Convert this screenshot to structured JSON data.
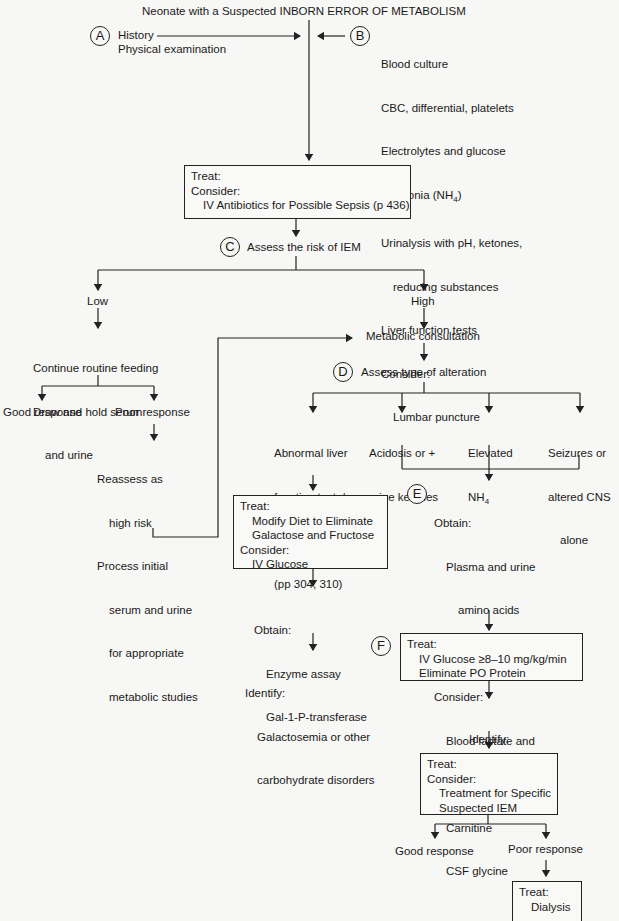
{
  "title": "Neonate with a Suspected INBORN ERROR OF METABOLISM",
  "step_a": {
    "marker": "A",
    "lines": [
      "History",
      "Physical examination"
    ]
  },
  "step_b": {
    "marker": "B",
    "lines": [
      "Blood culture",
      "CBC, differential, platelets",
      "Electrolytes and glucose",
      "Ammonia (NH4)",
      "Urinalysis with pH, ketones,",
      "reducing substances",
      "Liver function tests",
      "Consider:",
      "Lumbar puncture"
    ]
  },
  "treat_sepsis": {
    "lines": [
      "Treat:",
      "Consider:",
      "IV Antibiotics for Possible Sepsis (p 436)"
    ]
  },
  "step_c": {
    "marker": "C",
    "label": "Assess the risk of IEM"
  },
  "low": {
    "label": "Low",
    "action": [
      "Continue routine feeding",
      "Draw and hold serum",
      "and urine"
    ],
    "good": "Good response",
    "poor": "Poor response",
    "reassess": [
      "Reassess as",
      "high risk",
      "Process initial",
      "serum and urine",
      "for appropriate",
      "metabolic studies"
    ]
  },
  "high": {
    "label": "High",
    "consult": "Metabolic consultation"
  },
  "step_d": {
    "marker": "D",
    "label": "Assess type of alteration"
  },
  "alterations": [
    {
      "lines": [
        "Abnormal liver",
        "function tests/",
        "liver disease",
        "(pp 304, 310)"
      ]
    },
    {
      "lines": [
        "Acidosis or +",
        "urine ketones"
      ]
    },
    {
      "lines": [
        "Elevated",
        "NH4"
      ]
    },
    {
      "lines": [
        "Seizures or",
        "altered CNS",
        "alone"
      ]
    }
  ],
  "liver_treat": {
    "lines": [
      "Treat:",
      "Modify Diet to Eliminate",
      "Galactose and Fructose",
      "Consider:",
      "IV Glucose"
    ]
  },
  "liver_obtain": {
    "lines": [
      "Obtain:",
      "Enzyme assay",
      "Gal-1-P-transferase"
    ]
  },
  "liver_identify": {
    "lines": [
      "Identify:",
      "Galactosemia or other",
      "carbohydrate disorders"
    ]
  },
  "step_e": {
    "marker": "E",
    "lines": [
      "Obtain:",
      "Plasma and urine",
      "amino acids",
      "Urine organic acids",
      "Consider:",
      "Blood lactate and",
      "pyruvate",
      "Carnitine",
      "CSF glycine"
    ]
  },
  "step_f": {
    "marker": "F",
    "lines": [
      "Treat:",
      "IV Glucose ≥8–10 mg/kg/min",
      "Eliminate PO Protein"
    ]
  },
  "identify_iem": {
    "lines": [
      "Identify:",
      "IEM"
    ]
  },
  "treat_specific": {
    "lines": [
      "Treat:",
      "Consider:",
      "Treatment for Specific",
      "Suspected IEM"
    ]
  },
  "final": {
    "good": "Good response",
    "poor": "Poor response",
    "treat_lines": [
      "Treat:",
      "Dialysis"
    ]
  }
}
